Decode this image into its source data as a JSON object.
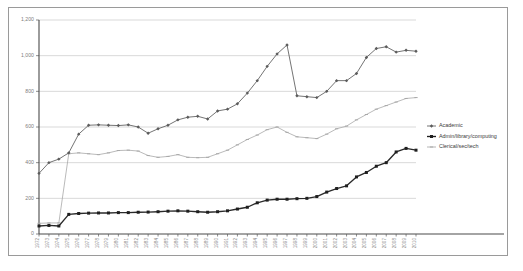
{
  "chart_data": {
    "type": "line",
    "title": "",
    "xlabel": "",
    "ylabel": "",
    "ylim": [
      0,
      1200
    ],
    "yticks": [
      0,
      200,
      400,
      600,
      800,
      1000,
      1200
    ],
    "ytick_labels": [
      "0",
      "200",
      "400",
      "600",
      "800",
      "1,000",
      "1,200"
    ],
    "grid": true,
    "legend_position": "right",
    "categories": [
      "1972",
      "1973",
      "1974",
      "1975",
      "1976",
      "1977",
      "1978",
      "1979",
      "1980",
      "1981",
      "1982",
      "1983",
      "1984",
      "1985",
      "1986",
      "1987",
      "1988",
      "1989",
      "1990",
      "1991",
      "1992",
      "1993",
      "1994",
      "1995",
      "1996",
      "1997",
      "1998",
      "1999",
      "2000",
      "2001",
      "2002",
      "2003",
      "2004",
      "2005",
      "2006",
      "2007",
      "2008",
      "2009",
      "2010"
    ],
    "series": [
      {
        "name": "Academic",
        "color": "#5b5b5b",
        "marker": "diamond",
        "values": [
          340,
          400,
          420,
          455,
          560,
          610,
          612,
          610,
          608,
          612,
          600,
          565,
          590,
          610,
          640,
          655,
          660,
          645,
          690,
          700,
          730,
          790,
          860,
          940,
          1010,
          1060,
          775,
          770,
          765,
          800,
          860,
          860,
          900,
          990,
          1040,
          1050,
          1020,
          1030,
          1025
        ]
      },
      {
        "name": "Admin/library/computing",
        "color": "#1f1f1f",
        "marker": "square",
        "values": [
          45,
          48,
          45,
          110,
          115,
          117,
          118,
          118,
          120,
          120,
          122,
          123,
          125,
          128,
          130,
          128,
          125,
          122,
          125,
          130,
          140,
          150,
          175,
          190,
          195,
          195,
          198,
          200,
          210,
          235,
          255,
          270,
          320,
          345,
          380,
          400,
          460,
          480,
          470
        ]
      },
      {
        "name": "Clerical/sec/tech",
        "color": "#a8a8a8",
        "marker": "dash",
        "values": [
          60,
          62,
          62,
          450,
          455,
          450,
          445,
          455,
          468,
          470,
          465,
          440,
          430,
          435,
          445,
          430,
          428,
          430,
          450,
          470,
          500,
          530,
          555,
          585,
          600,
          570,
          545,
          540,
          535,
          560,
          590,
          605,
          640,
          670,
          700,
          720,
          740,
          760,
          765
        ]
      }
    ],
    "legend": [
      {
        "label": "Academic",
        "color": "#5b5b5b",
        "marker": "diamond"
      },
      {
        "label": "Admin/library/computing",
        "color": "#1f1f1f",
        "marker": "square"
      },
      {
        "label": "Clerical/sec/tech",
        "color": "#a8a8a8",
        "marker": "dash"
      }
    ]
  }
}
